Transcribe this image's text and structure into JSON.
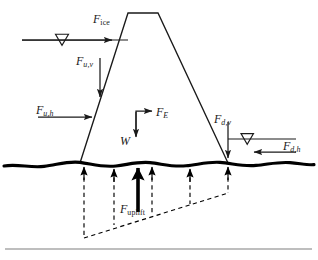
{
  "figure": {
    "kind": "engineering-force-diagram"
  },
  "labels": {
    "f_ice": {
      "symbol": "F",
      "subscript": "ice",
      "subscript_style": "upright",
      "text": "F_ice",
      "x": 93,
      "y": 13,
      "force": "ice load",
      "direction": "horizontal-right"
    },
    "f_uv": {
      "symbol": "F",
      "subscript": "u,v",
      "subscript_style": "italic",
      "text": "F_u,v",
      "x": 76,
      "y": 55,
      "force": "upstream vertical water load",
      "direction": "down"
    },
    "f_uh": {
      "symbol": "F",
      "subscript": "u,h",
      "subscript_style": "italic",
      "text": "F_u,h",
      "x": 36,
      "y": 104,
      "force": "upstream horizontal water load",
      "direction": "horizontal-right"
    },
    "f_e": {
      "symbol": "F",
      "subscript": "E",
      "subscript_style": "italic",
      "text": "F_E",
      "x": 156,
      "y": 106,
      "force": "earthquake inertia load",
      "direction": "horizontal-right"
    },
    "w": {
      "symbol": "W",
      "subscript": "",
      "subscript_style": "none",
      "text": "W",
      "x": 120,
      "y": 135,
      "force": "self weight",
      "direction": "down"
    },
    "f_dv": {
      "symbol": "F",
      "subscript": "d,v",
      "subscript_style": "italic",
      "text": "F_d,v",
      "x": 214,
      "y": 113,
      "force": "downstream vertical water load",
      "direction": "down"
    },
    "f_dh": {
      "symbol": "F",
      "subscript": "d,h",
      "subscript_style": "italic",
      "text": "F_d,h",
      "x": 283,
      "y": 140,
      "force": "downstream horizontal water load",
      "direction": "horizontal-left"
    },
    "f_uplift": {
      "symbol": "F",
      "subscript": "uplift",
      "subscript_style": "upright",
      "text": "F_uplift",
      "x": 120,
      "y": 203,
      "force": "uplift resultant",
      "direction": "up"
    }
  },
  "geometry": {
    "dam": {
      "crest_left_x": 128,
      "crest_right_x": 158,
      "crest_y": 13,
      "base_left_x": 80,
      "base_right_x": 228,
      "base_y": 163
    },
    "ground_line_y": 163,
    "upstream_water_line": {
      "x_start": 22,
      "x_end": 128,
      "y": 40,
      "marker_x": 62
    },
    "downstream_water_line": {
      "x_start": 228,
      "x_end": 296,
      "y": 139,
      "marker_x": 247
    },
    "uplift_arrows_x": [
      84,
      114,
      138,
      152,
      190,
      228
    ],
    "uplift_diagram_bottom_y": 238
  },
  "colors": {
    "ink": "#1a1a1a",
    "ground": "#000000",
    "rule": "#a8a8a8",
    "background": "#ffffff"
  },
  "footer": {
    "rule_y": 249
  }
}
